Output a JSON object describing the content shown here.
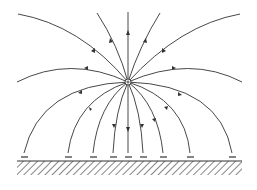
{
  "diagram": {
    "title": "",
    "charge": {
      "symbol": "+",
      "x": 128,
      "y": 82
    },
    "ground": {
      "x1": 17,
      "x2": 242,
      "y": 161,
      "height": 14
    },
    "induced_charges": {
      "symbol": "−",
      "xs": [
        24,
        68,
        93,
        113,
        128,
        143,
        163,
        190,
        232
      ]
    },
    "colors": {
      "line": "#333333",
      "background": "#ffffff"
    }
  }
}
